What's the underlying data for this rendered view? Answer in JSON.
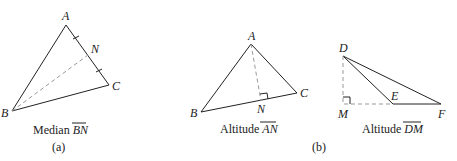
{
  "figure_a": {
    "points": {
      "A": "A",
      "B": "B",
      "C": "C",
      "N": "N"
    },
    "caption_prefix": "Median",
    "caption_segment": "BN",
    "sublabel": "(a)"
  },
  "figure_b1": {
    "points": {
      "A": "A",
      "B": "B",
      "C": "C",
      "N": "N"
    },
    "caption_prefix": "Altitude",
    "caption_segment": "AN"
  },
  "figure_b2": {
    "points": {
      "D": "D",
      "E": "E",
      "F": "F",
      "M": "M"
    },
    "caption_prefix": "Altitude",
    "caption_segment": "DM"
  },
  "sublabel_b": "(b)"
}
